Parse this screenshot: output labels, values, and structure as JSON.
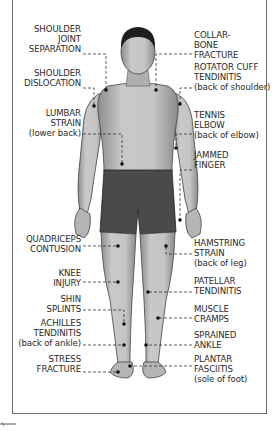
{
  "diagram": {
    "type": "anatomical-injury-map",
    "colors": {
      "ink": "#2a2a2a",
      "skin": "#b9b9b9",
      "shorts": "#4a4a4a",
      "hair": "#1e1e1e",
      "frame": "#6b6b6b"
    },
    "left_labels": [
      {
        "id": "shoulder-joint-separation",
        "text": "SHOULDER\nJOINT\nSEPARATION"
      },
      {
        "id": "shoulder-dislocation",
        "text": "SHOULDER\nDISLOCATION"
      },
      {
        "id": "lumbar-strain",
        "text": "LUMBAR\nSTRAIN\n(lower back)"
      },
      {
        "id": "quadriceps-contusion",
        "text": "QUADRICEPS\nCONTUSION"
      },
      {
        "id": "knee-injury",
        "text": "KNEE\nINJURY"
      },
      {
        "id": "shin-splints",
        "text": "SHIN\nSPLINTS"
      },
      {
        "id": "achilles-tendinitis",
        "text": "ACHILLES\nTENDINITIS\n(back of ankle)"
      },
      {
        "id": "stress-fracture",
        "text": "STRESS\nFRACTURE"
      }
    ],
    "right_labels": [
      {
        "id": "collarbone-fracture",
        "text": "COLLAR-\nBONE\nFRACTURE"
      },
      {
        "id": "rotator-cuff-tendinitis",
        "text": "ROTATOR CUFF\nTENDINITIS\n(back of shoulder)"
      },
      {
        "id": "tennis-elbow",
        "text": "TENNIS\nELBOW\n(back of elbow)"
      },
      {
        "id": "jammed-finger",
        "text": "JAMMED\nFINGER"
      },
      {
        "id": "hamstring-strain",
        "text": "HAMSTRING\nSTRAIN\n(back of leg)"
      },
      {
        "id": "patellar-tendinitis",
        "text": "PATELLAR\nTENDINITIS"
      },
      {
        "id": "muscle-cramps",
        "text": "MUSCLE\nCRAMPS"
      },
      {
        "id": "sprained-ankle",
        "text": "SPRAINED\nANKLE"
      },
      {
        "id": "plantar-fasciitis",
        "text": "PLANTAR\nFASCIITIS\n(sole of foot)"
      }
    ]
  }
}
